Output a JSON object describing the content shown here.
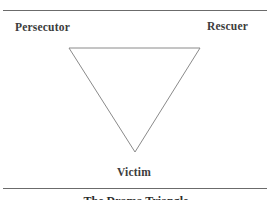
{
  "diagram": {
    "title": "The Drama Triangle",
    "nodes": [
      {
        "id": "persecutor",
        "label": "Persecutor",
        "position": "top-left"
      },
      {
        "id": "rescuer",
        "label": "Rescuer",
        "position": "top-right"
      },
      {
        "id": "victim",
        "label": "Victim",
        "position": "bottom"
      }
    ],
    "shape": "inverted-triangle",
    "colors": {
      "line": "#8a8a8a",
      "text": "#3c3c3c",
      "rule": "#6b6b6b"
    }
  }
}
